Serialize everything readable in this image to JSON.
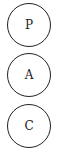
{
  "nodes": [
    {
      "label": "P"
    },
    {
      "label": "A"
    },
    {
      "label": "C"
    }
  ],
  "colors": {
    "stroke": "#222222",
    "text": "#222222",
    "background": "#ffffff"
  }
}
